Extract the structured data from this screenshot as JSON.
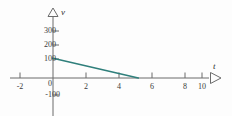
{
  "figure": {
    "name": "velocity-time-graph",
    "background_color": "#fdfdfd",
    "width": 232,
    "height": 116
  },
  "axes": {
    "x_axis": {
      "variable_label": "t",
      "color": "#6b6b6b",
      "arrow": "right-triangle-outline",
      "pixel_y": 78,
      "pixel_x_start": 10,
      "pixel_x_end": 212
    },
    "y_axis": {
      "variable_label": "v",
      "color": "#6b6b6b",
      "arrow": "up-triangle-outline",
      "pixel_x": 53,
      "pixel_y_start": 12,
      "pixel_y_end": 116
    }
  },
  "chart_data": {
    "type": "line",
    "title": "",
    "subtitle": "",
    "xlabel": "t",
    "ylabel": "v",
    "xlim": [
      -2.6,
      11.5
    ],
    "ylim": [
      -130,
      330
    ],
    "grid": false,
    "legend": null,
    "xticks": [
      -2,
      0,
      2,
      4,
      6,
      8,
      10
    ],
    "xtick_labels": [
      "-2",
      "0",
      "2",
      "4",
      "6",
      "8",
      "10"
    ],
    "yticks": [
      -100,
      0,
      100,
      200,
      300
    ],
    "ytick_labels": [
      "-100",
      "0",
      "100",
      "200",
      "300"
    ],
    "series": [
      {
        "name": "velocity",
        "color": "#2f7f7b",
        "line_width": 1.6,
        "x": [
          0,
          5.2
        ],
        "y": [
          138,
          0
        ]
      }
    ],
    "annotations": []
  }
}
